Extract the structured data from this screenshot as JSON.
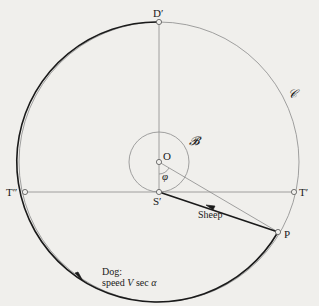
{
  "diagram": {
    "background": "#f0efec",
    "colors": {
      "thick_line": "#1a1a1a",
      "thin_line": "#8a8a8a",
      "text": "#1a1a1a"
    },
    "labels": {
      "D_prime": "D′",
      "O": "O",
      "S_prime": "S′",
      "T_prime": "T′",
      "T_double_prime": "T″",
      "P": "P",
      "phi": "φ",
      "circle_B": "𝓑",
      "circle_C": "𝒞",
      "sheep": "Sheep",
      "dog_line1": "Dog:",
      "dog_line2_prefix": "speed ",
      "dog_speed_var": "V",
      "dog_speed_sec": " sec ",
      "dog_speed_alpha": "α"
    },
    "geometry": {
      "center_O": [
        159,
        162
      ],
      "large_circle_radius": 140,
      "small_circle_radius": 30,
      "S_prime": [
        159,
        192
      ],
      "D_prime": [
        159,
        22
      ],
      "T_prime": [
        294,
        192
      ],
      "T_double_prime": [
        25,
        192
      ],
      "P": [
        278,
        232
      ]
    }
  }
}
